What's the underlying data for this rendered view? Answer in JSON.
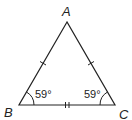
{
  "diagram": {
    "vertices": {
      "A": {
        "label": "A",
        "x": 67,
        "y": 22
      },
      "B": {
        "label": "B",
        "x": 19,
        "y": 105
      },
      "C": {
        "label": "C",
        "x": 115,
        "y": 105
      }
    },
    "angles": {
      "B": {
        "label": "59°"
      },
      "C": {
        "label": "59°"
      }
    },
    "tick_marks": {
      "AB": 1,
      "AC": 1,
      "BC": 2
    },
    "line_color": "#222222"
  }
}
